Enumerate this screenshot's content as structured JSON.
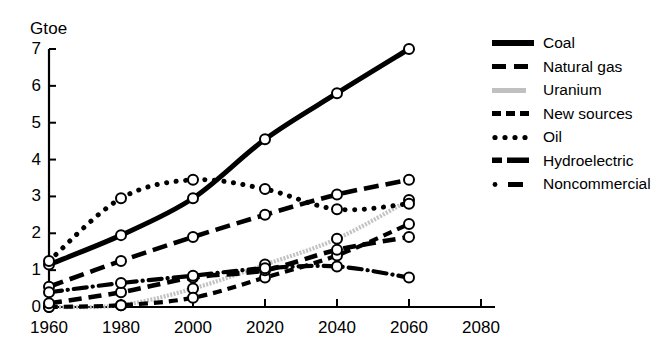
{
  "chart_data": {
    "type": "line",
    "title": "",
    "subtitle": "",
    "xlabel": "",
    "ylabel": "Gtoe",
    "xlim": [
      1960,
      2080
    ],
    "ylim": [
      0,
      7
    ],
    "xticks": [
      1960,
      1980,
      2000,
      2020,
      2040,
      2060,
      2080
    ],
    "yticks": [
      0,
      1,
      2,
      3,
      4,
      5,
      6,
      7
    ],
    "grid": false,
    "legend_position": "right",
    "marker": "open-circle",
    "series": [
      {
        "name": "Coal",
        "style": "solid-thick",
        "color": "#000000",
        "x": [
          1960,
          1980,
          2000,
          2020,
          2040,
          2060
        ],
        "values": [
          1.15,
          1.95,
          2.95,
          4.55,
          5.8,
          7.0
        ]
      },
      {
        "name": "Natural gas",
        "style": "long-dash",
        "color": "#000000",
        "x": [
          1960,
          1980,
          2000,
          2020,
          2040,
          2060
        ],
        "values": [
          0.55,
          1.25,
          1.9,
          2.5,
          3.05,
          3.45
        ]
      },
      {
        "name": "Uranium",
        "style": "light-hatch",
        "color": "#b8b8b8",
        "x": [
          1960,
          1980,
          2000,
          2020,
          2040,
          2060
        ],
        "values": [
          0.0,
          0.05,
          0.5,
          1.15,
          1.85,
          2.9
        ]
      },
      {
        "name": "New sources",
        "style": "short-dash",
        "color": "#000000",
        "x": [
          1960,
          1980,
          2000,
          2020,
          2040,
          2060
        ],
        "values": [
          0.0,
          0.05,
          0.25,
          0.8,
          1.4,
          2.25
        ]
      },
      {
        "name": "Oil",
        "style": "dotted",
        "color": "#000000",
        "x": [
          1960,
          1980,
          2000,
          2020,
          2040,
          2060
        ],
        "values": [
          1.25,
          2.95,
          3.45,
          3.2,
          2.65,
          2.8
        ]
      },
      {
        "name": "Hydroelectric",
        "style": "medium-dash",
        "color": "#000000",
        "x": [
          1960,
          1980,
          2000,
          2020,
          2040,
          2060
        ],
        "values": [
          0.1,
          0.4,
          0.8,
          1.0,
          1.55,
          1.9
        ]
      },
      {
        "name": "Noncommercial",
        "style": "dash-dot",
        "color": "#000000",
        "x": [
          1960,
          1980,
          2000,
          2020,
          2040,
          2060
        ],
        "values": [
          0.4,
          0.65,
          0.85,
          1.05,
          1.1,
          0.8
        ]
      }
    ]
  },
  "axis": {
    "y_title": "Gtoe",
    "y_labels": [
      "7",
      "6",
      "5",
      "4",
      "3",
      "2",
      "1",
      "0"
    ],
    "x_labels": [
      "1960",
      "1980",
      "2000",
      "2020",
      "2040",
      "2060",
      "2080"
    ]
  },
  "legend": {
    "items": [
      {
        "label": "Coal",
        "key": "solid-thick-key"
      },
      {
        "label": "Natural gas",
        "key": "long-dash-key"
      },
      {
        "label": "Uranium",
        "key": "light-hatch-key"
      },
      {
        "label": "New sources",
        "key": "short-dash-key"
      },
      {
        "label": "Oil",
        "key": "dotted-key"
      },
      {
        "label": "Hydroelectric",
        "key": "medium-dash-key"
      },
      {
        "label": "Noncommercial",
        "key": "dash-dot-key"
      }
    ]
  }
}
